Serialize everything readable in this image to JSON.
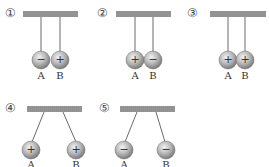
{
  "diagram": {
    "panels": [
      {
        "number": "①",
        "ball_a": {
          "label": "A",
          "charge": "−"
        },
        "ball_b": {
          "label": "B",
          "charge": "+"
        },
        "arrangement": "touching"
      },
      {
        "number": "②",
        "ball_a": {
          "label": "A",
          "charge": "+"
        },
        "ball_b": {
          "label": "B",
          "charge": "−"
        },
        "arrangement": "touching"
      },
      {
        "number": "③",
        "ball_a": {
          "label": "A",
          "charge": "+"
        },
        "ball_b": {
          "label": "B",
          "charge": "+"
        },
        "arrangement": "touching"
      },
      {
        "number": "④",
        "ball_a": {
          "label": "A",
          "charge": "+"
        },
        "ball_b": {
          "label": "B",
          "charge": "+"
        },
        "arrangement": "repelled"
      },
      {
        "number": "⑤",
        "ball_a": {
          "label": "A",
          "charge": "−"
        },
        "ball_b": {
          "label": "B",
          "charge": "−"
        },
        "arrangement": "repelled"
      }
    ]
  },
  "colors": {
    "bar": "#909090",
    "ball_light": "#eeeeee",
    "ball_dark": "#8a8a8a",
    "string": "#444444"
  }
}
